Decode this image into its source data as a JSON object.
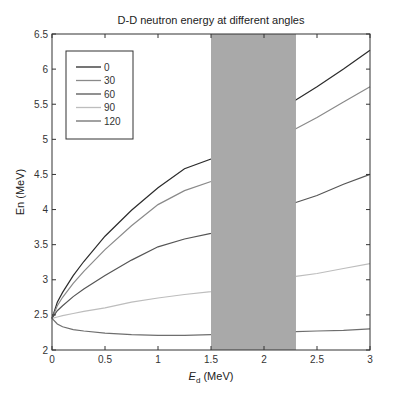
{
  "chart_data": {
    "type": "line",
    "title": "D-D neutron energy at different angles",
    "xlabel": "E_d (MeV)",
    "xlabel_main": "E",
    "xlabel_sub": "d",
    "xlabel_unit": " (MeV)",
    "ylabel": "En (MeV)",
    "xlim": [
      0,
      3
    ],
    "ylim": [
      2,
      6.5
    ],
    "xticks": [
      0,
      0.5,
      1,
      1.5,
      2,
      2.5,
      3
    ],
    "xtick_labels": [
      "0",
      "0.5",
      "1",
      "1.5",
      "2",
      "2.5",
      "3"
    ],
    "yticks": [
      2,
      2.5,
      3,
      3.5,
      4,
      4.5,
      5,
      5.5,
      6,
      6.5
    ],
    "ytick_labels": [
      "2",
      "2.5",
      "3",
      "3.5",
      "4",
      "4.5",
      "5",
      "5.5",
      "6",
      "6.5"
    ],
    "grid": false,
    "legend_position": "upper left",
    "shaded_region": {
      "x_start": 1.5,
      "x_end": 2.3,
      "color": "#a9a9a9"
    },
    "x": [
      0,
      0.05,
      0.1,
      0.2,
      0.3,
      0.5,
      0.75,
      1.0,
      1.25,
      1.5,
      2.3,
      2.5,
      2.75,
      3.0
    ],
    "series": [
      {
        "name": "0",
        "color": "#2b2b2b",
        "values": [
          2.45,
          2.68,
          2.82,
          3.06,
          3.26,
          3.62,
          3.99,
          4.31,
          4.58,
          4.72,
          5.56,
          5.75,
          6.0,
          6.27
        ]
      },
      {
        "name": "30",
        "color": "#8a8a8a",
        "values": [
          2.45,
          2.63,
          2.75,
          2.95,
          3.12,
          3.43,
          3.77,
          4.07,
          4.27,
          4.4,
          5.15,
          5.31,
          5.53,
          5.75
        ]
      },
      {
        "name": "60",
        "color": "#555555",
        "values": [
          2.45,
          2.56,
          2.63,
          2.76,
          2.87,
          3.06,
          3.28,
          3.47,
          3.58,
          3.66,
          4.1,
          4.2,
          4.36,
          4.5
        ]
      },
      {
        "name": "90",
        "color": "#bdbdbd",
        "values": [
          2.45,
          2.47,
          2.49,
          2.52,
          2.55,
          2.6,
          2.68,
          2.74,
          2.79,
          2.83,
          3.05,
          3.09,
          3.16,
          3.23
        ]
      },
      {
        "name": "120",
        "color": "#6e6e6e",
        "values": [
          2.45,
          2.37,
          2.33,
          2.29,
          2.27,
          2.24,
          2.22,
          2.21,
          2.21,
          2.22,
          2.26,
          2.27,
          2.28,
          2.3
        ]
      }
    ]
  }
}
